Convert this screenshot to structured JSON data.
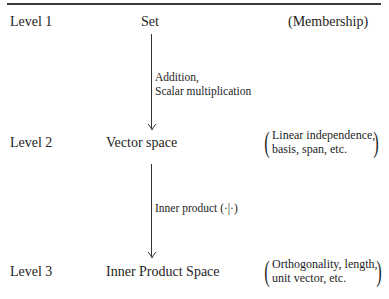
{
  "diagram": {
    "levels": [
      {
        "label": "Level 1",
        "structure": "Set",
        "property": "(Membership)"
      },
      {
        "label": "Level 2",
        "structure": "Vector space",
        "property_lines": [
          "Linear independence,",
          "basis, span, etc."
        ]
      },
      {
        "label": "Level 3",
        "structure": "Inner Product Space",
        "property_lines": [
          "Orthogonality, length,",
          "unit vector, etc."
        ]
      }
    ],
    "transitions": [
      {
        "from": "Set",
        "to": "Vector space",
        "label_lines": [
          "Addition,",
          "Scalar multiplication"
        ]
      },
      {
        "from": "Vector space",
        "to": "Inner Product Space",
        "label_lines": [
          "Inner product (·|·)"
        ]
      }
    ],
    "paren_open": "(",
    "paren_close": ")"
  }
}
